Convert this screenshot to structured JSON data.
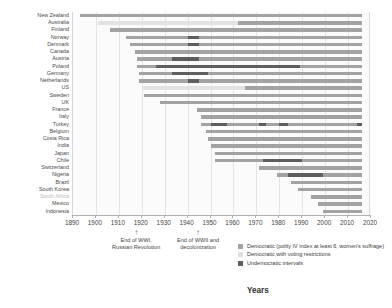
{
  "chart_data": {
    "type": "bar",
    "subtype": "horizontal-stacked-timeline",
    "title": "",
    "xlabel": "Years",
    "ylabel": "",
    "xlim": [
      1890,
      2020
    ],
    "xticks": [
      1890,
      1900,
      1910,
      1920,
      1930,
      1940,
      1950,
      1960,
      1970,
      1980,
      1990,
      2000,
      2010,
      2020
    ],
    "grid": true,
    "grid_axis": "x",
    "legend_position": "bottom-right",
    "series": [
      {
        "name": "Democratic (polity IV index at least 6, women's suffrage)",
        "key": "dem",
        "color": "#a3a3a3"
      },
      {
        "name": "Democratic with voting restrictions",
        "key": "restricted",
        "color": "#e0e0e0"
      },
      {
        "name": "Undemocratic intervals",
        "key": "undem",
        "color": "#5e5e5e"
      }
    ],
    "end_year": 2016,
    "categories": [
      "New Zealand",
      "Australia",
      "Finland",
      "Norway",
      "Denmark",
      "Canada",
      "Austria",
      "Poland",
      "Germany",
      "Netherlands",
      "US",
      "Sweden",
      "UK",
      "France",
      "Italy",
      "Turkey",
      "Belgium",
      "Costa Rica",
      "India",
      "Japan",
      "Chile",
      "Switzerland",
      "Nigeria",
      "Brazil",
      "South Korea",
      "South Africa",
      "Mexico",
      "Indonesia"
    ],
    "faded_categories": [
      "South Africa"
    ],
    "rows": [
      {
        "country": "New Zealand",
        "segments": [
          {
            "type": "dem",
            "start": 1893,
            "end": 2016
          }
        ]
      },
      {
        "country": "Australia",
        "segments": [
          {
            "type": "restricted",
            "start": 1901,
            "end": 1962
          },
          {
            "type": "dem",
            "start": 1962,
            "end": 2016
          }
        ]
      },
      {
        "country": "Finland",
        "segments": [
          {
            "type": "dem",
            "start": 1906,
            "end": 2016
          }
        ]
      },
      {
        "country": "Norway",
        "segments": [
          {
            "type": "dem",
            "start": 1913,
            "end": 1940
          },
          {
            "type": "undem",
            "start": 1940,
            "end": 1945
          },
          {
            "type": "dem",
            "start": 1945,
            "end": 2016
          }
        ]
      },
      {
        "country": "Denmark",
        "segments": [
          {
            "type": "dem",
            "start": 1915,
            "end": 1940
          },
          {
            "type": "undem",
            "start": 1940,
            "end": 1945
          },
          {
            "type": "dem",
            "start": 1945,
            "end": 2016
          }
        ]
      },
      {
        "country": "Canada",
        "segments": [
          {
            "type": "dem",
            "start": 1917,
            "end": 2016
          }
        ]
      },
      {
        "country": "Austria",
        "segments": [
          {
            "type": "dem",
            "start": 1918,
            "end": 1933
          },
          {
            "type": "undem",
            "start": 1933,
            "end": 1945
          },
          {
            "type": "dem",
            "start": 1945,
            "end": 2016
          }
        ]
      },
      {
        "country": "Poland",
        "segments": [
          {
            "type": "dem",
            "start": 1918,
            "end": 1926
          },
          {
            "type": "undem",
            "start": 1926,
            "end": 1989
          },
          {
            "type": "dem",
            "start": 1989,
            "end": 2016
          }
        ]
      },
      {
        "country": "Germany",
        "segments": [
          {
            "type": "dem",
            "start": 1919,
            "end": 1933
          },
          {
            "type": "undem",
            "start": 1933,
            "end": 1949
          },
          {
            "type": "dem",
            "start": 1949,
            "end": 2016
          }
        ]
      },
      {
        "country": "Netherlands",
        "segments": [
          {
            "type": "dem",
            "start": 1919,
            "end": 1940
          },
          {
            "type": "undem",
            "start": 1940,
            "end": 1945
          },
          {
            "type": "dem",
            "start": 1945,
            "end": 2016
          }
        ]
      },
      {
        "country": "US",
        "segments": [
          {
            "type": "restricted",
            "start": 1920,
            "end": 1965
          },
          {
            "type": "dem",
            "start": 1965,
            "end": 2016
          }
        ]
      },
      {
        "country": "Sweden",
        "segments": [
          {
            "type": "dem",
            "start": 1921,
            "end": 2016
          }
        ]
      },
      {
        "country": "UK",
        "segments": [
          {
            "type": "dem",
            "start": 1928,
            "end": 2016
          }
        ]
      },
      {
        "country": "France",
        "segments": [
          {
            "type": "dem",
            "start": 1944,
            "end": 2016
          }
        ]
      },
      {
        "country": "Italy",
        "segments": [
          {
            "type": "dem",
            "start": 1946,
            "end": 2016
          }
        ]
      },
      {
        "country": "Turkey",
        "segments": [
          {
            "type": "dem",
            "start": 1946,
            "end": 1950
          },
          {
            "type": "undem",
            "start": 1950,
            "end": 1957
          },
          {
            "type": "dem",
            "start": 1957,
            "end": 1971
          },
          {
            "type": "undem",
            "start": 1971,
            "end": 1974
          },
          {
            "type": "dem",
            "start": 1974,
            "end": 1980
          },
          {
            "type": "undem",
            "start": 1980,
            "end": 1984
          },
          {
            "type": "dem",
            "start": 1984,
            "end": 2014
          },
          {
            "type": "undem",
            "start": 2014,
            "end": 2016
          }
        ]
      },
      {
        "country": "Belgium",
        "segments": [
          {
            "type": "dem",
            "start": 1948,
            "end": 2016
          }
        ]
      },
      {
        "country": "Costa Rica",
        "segments": [
          {
            "type": "dem",
            "start": 1949,
            "end": 2016
          }
        ]
      },
      {
        "country": "India",
        "segments": [
          {
            "type": "dem",
            "start": 1950,
            "end": 2016
          }
        ]
      },
      {
        "country": "Japan",
        "segments": [
          {
            "type": "dem",
            "start": 1952,
            "end": 2016
          }
        ]
      },
      {
        "country": "Chile",
        "segments": [
          {
            "type": "dem",
            "start": 1952,
            "end": 1973
          },
          {
            "type": "undem",
            "start": 1973,
            "end": 1990
          },
          {
            "type": "dem",
            "start": 1990,
            "end": 2016
          }
        ]
      },
      {
        "country": "Switzerland",
        "segments": [
          {
            "type": "dem",
            "start": 1971,
            "end": 2016
          }
        ]
      },
      {
        "country": "Nigeria",
        "segments": [
          {
            "type": "dem",
            "start": 1979,
            "end": 1984
          },
          {
            "type": "undem",
            "start": 1984,
            "end": 1999
          },
          {
            "type": "dem",
            "start": 1999,
            "end": 2016
          }
        ]
      },
      {
        "country": "Brazil",
        "segments": [
          {
            "type": "dem",
            "start": 1985,
            "end": 2016
          }
        ]
      },
      {
        "country": "South Korea",
        "segments": [
          {
            "type": "dem",
            "start": 1988,
            "end": 2016
          }
        ]
      },
      {
        "country": "South Africa",
        "segments": [
          {
            "type": "dem",
            "start": 1994,
            "end": 2016
          }
        ]
      },
      {
        "country": "Mexico",
        "segments": [
          {
            "type": "dem",
            "start": 1997,
            "end": 2016
          }
        ]
      },
      {
        "country": "Indonesia",
        "segments": [
          {
            "type": "dem",
            "start": 1999,
            "end": 2016
          }
        ]
      }
    ],
    "annotations": [
      {
        "id": "wwi",
        "year": 1918,
        "arrow": "↑",
        "text": "End of WWI,\nRussian Revolution"
      },
      {
        "id": "wwii",
        "year": 1945,
        "arrow": "↑",
        "text": "End of WWII and\ndecolonization"
      }
    ]
  }
}
